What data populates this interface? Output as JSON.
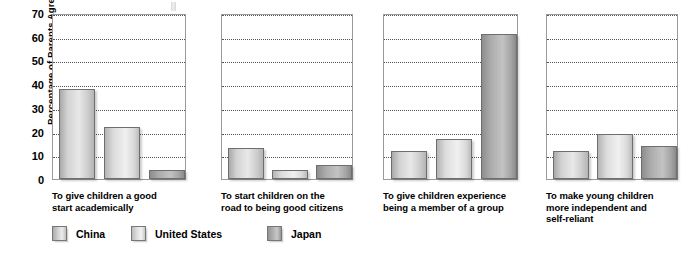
{
  "chart_data": {
    "type": "bar",
    "title": "",
    "xlabel": "",
    "ylabel": "Percentage of Parents Agreeing",
    "ylim": [
      0,
      70
    ],
    "yticks": [
      0,
      10,
      20,
      30,
      40,
      50,
      60,
      70
    ],
    "grid": true,
    "legend_position": "bottom-left",
    "panel_layout": "four side-by-side panels sharing one y-axis",
    "categories": [
      "To give children a good start academically",
      "To start children on the road to being good citizens",
      "To give children experience being a member of a group",
      "To make young children more independent and self-reliant"
    ],
    "categories_lines": [
      [
        "To give children a good",
        "start academically"
      ],
      [
        "To start children on the",
        "road to being good citizens"
      ],
      [
        "To give children experience",
        "being a member of a group"
      ],
      [
        "To make young children",
        "more independent and",
        "self-reliant"
      ]
    ],
    "series": [
      {
        "name": "China",
        "values": [
          38,
          13,
          12,
          12
        ]
      },
      {
        "name": "United States",
        "values": [
          22,
          4,
          17,
          19
        ]
      },
      {
        "name": "Japan",
        "values": [
          4,
          6,
          61,
          14
        ]
      }
    ]
  },
  "legend": {
    "items": [
      {
        "label": "China",
        "key": "china"
      },
      {
        "label": "United States",
        "key": "us"
      },
      {
        "label": "Japan",
        "key": "japan"
      }
    ]
  },
  "colors": {
    "bar_china": "#d2d2d2",
    "bar_us": "#e2e2e2",
    "bar_japan": "#a5a5a5",
    "axis": "#9a9a9a",
    "gridline": "#555555",
    "text": "#000000",
    "background": "#ffffff"
  }
}
